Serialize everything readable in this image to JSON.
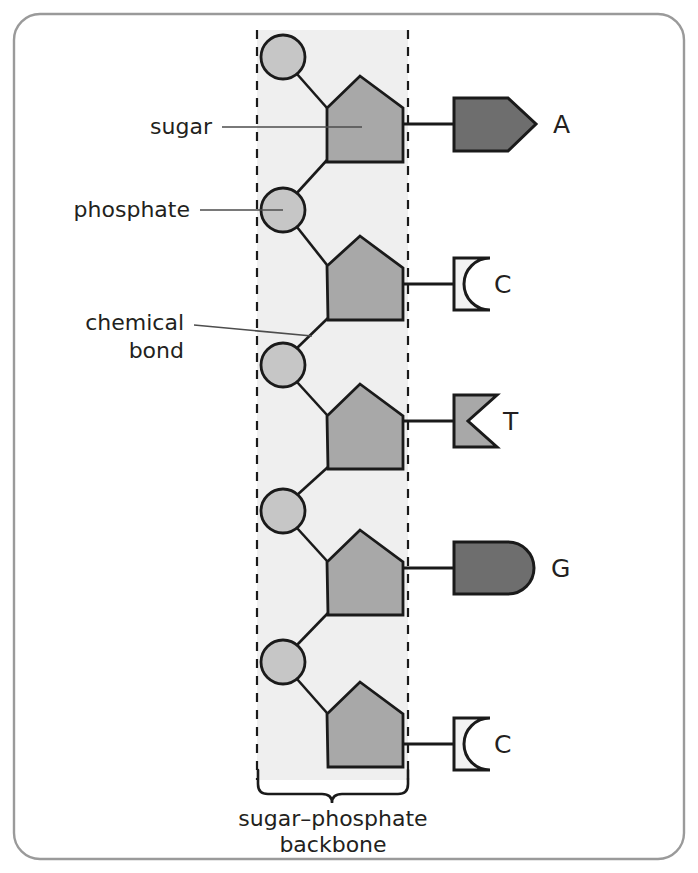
{
  "figure": {
    "frame_color": "#9a9a9a",
    "background": "#ffffff"
  },
  "colors": {
    "band_fill": "#efefef",
    "dash_line": "#1a1a1a",
    "sugar_fill": "#a8a8a8",
    "phosphate_fill": "#c6c6c6",
    "base_dark": "#6e6e6e",
    "base_mid": "#a8a8a8",
    "base_light": "#f2f2f2",
    "outline": "#1a1a1a",
    "leader_line": "#4d4d4d",
    "text": "#231f20"
  },
  "labels": {
    "sugar": "sugar",
    "phosphate": "phosphate",
    "chemical_bond_line1": "chemical",
    "chemical_bond_line2": "bond",
    "backbone_line1": "sugar–phosphate",
    "backbone_line2": "backbone"
  },
  "backbone": {
    "band_left_x": 257,
    "band_right_x": 408,
    "band_top_y": 30,
    "band_bottom_y": 780,
    "description": "alternating phosphate and sugar units forming the sugar-phosphate backbone"
  },
  "units": [
    {
      "index": 1,
      "phosphate": {
        "cx": 283,
        "cy": 57,
        "r": 22
      },
      "sugar": {
        "cx": 358,
        "cy": 124
      },
      "base": {
        "letter": "A",
        "name": "adenine",
        "shape": "arrow-pentagon",
        "fill": "#6e6e6e",
        "x": 452,
        "y": 98,
        "w": 78,
        "h": 52
      }
    },
    {
      "index": 2,
      "phosphate": {
        "cx": 283,
        "cy": 210,
        "r": 22
      },
      "sugar": {
        "cx": 358,
        "cy": 283
      },
      "base": {
        "letter": "C",
        "name": "cytosine",
        "shape": "concave-notch-square",
        "fill": "#f2f2f2",
        "x": 452,
        "y": 258,
        "w": 36,
        "h": 52
      }
    },
    {
      "index": 3,
      "phosphate": {
        "cx": 283,
        "cy": 365,
        "r": 22
      },
      "sugar": {
        "cx": 358,
        "cy": 432
      },
      "base": {
        "letter": "T",
        "name": "thymine",
        "shape": "v-notch-square",
        "fill": "#a8a8a8",
        "x": 452,
        "y": 395,
        "w": 42,
        "h": 52
      }
    },
    {
      "index": 4,
      "phosphate": {
        "cx": 283,
        "cy": 511,
        "r": 22
      },
      "sugar": {
        "cx": 358,
        "cy": 578
      },
      "base": {
        "letter": "G",
        "name": "guanine",
        "shape": "round-end-rectangle",
        "fill": "#6e6e6e",
        "x": 452,
        "y": 542,
        "w": 82,
        "h": 52
      }
    },
    {
      "index": 5,
      "phosphate": {
        "cx": 283,
        "cy": 662,
        "r": 22
      },
      "sugar": {
        "cx": 358,
        "cy": 730
      },
      "base": {
        "letter": "C",
        "name": "cytosine",
        "shape": "concave-notch-square",
        "fill": "#f2f2f2",
        "x": 452,
        "y": 718,
        "w": 36,
        "h": 52
      }
    }
  ],
  "base_letters": {
    "a": "A",
    "c1": "C",
    "t": "T",
    "g": "G",
    "c2": "C"
  }
}
